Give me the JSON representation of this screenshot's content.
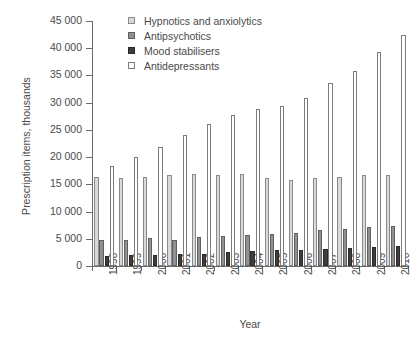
{
  "chart_data": {
    "type": "bar",
    "title": "",
    "xlabel": "Year",
    "ylabel": "Prescription items, thousands",
    "categories": [
      "1998",
      "1999",
      "2000",
      "2001",
      "2002",
      "2003",
      "2004",
      "2005",
      "2006",
      "2007",
      "2008",
      "2009",
      "2010"
    ],
    "ylim": [
      0,
      45000
    ],
    "ytick_values": [
      0,
      5000,
      10000,
      15000,
      20000,
      25000,
      30000,
      35000,
      40000,
      45000
    ],
    "ytick_labels": [
      "0",
      "5 000",
      "10 000",
      "15 000",
      "20 000",
      "25 000",
      "30 000",
      "35 000",
      "40 000",
      "45 000"
    ],
    "grid": false,
    "legend_position": "top-center",
    "series": [
      {
        "name": "Hypnotics and anxiolytics",
        "color": "#d9d9d9",
        "values": [
          16400,
          16200,
          16350,
          16700,
          16900,
          16800,
          16900,
          16250,
          15750,
          16150,
          16400,
          16700,
          16800
        ]
      },
      {
        "name": "Antipsychotics",
        "color": "#909090",
        "values": [
          4700,
          4800,
          5150,
          4800,
          5300,
          5500,
          5750,
          5800,
          6100,
          6550,
          6850,
          7150,
          7300
        ]
      },
      {
        "name": "Mood stabilisers",
        "color": "#3d3d3d",
        "values": [
          1900,
          1950,
          2100,
          2150,
          2250,
          2500,
          2750,
          2850,
          2950,
          3150,
          3250,
          3450,
          3600
        ]
      },
      {
        "name": "Antidepressants",
        "color": "#ffffff",
        "values": [
          18300,
          20000,
          21900,
          24100,
          26050,
          27700,
          28800,
          29300,
          30900,
          33700,
          35800,
          39300,
          42500
        ]
      }
    ]
  }
}
